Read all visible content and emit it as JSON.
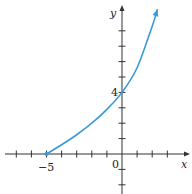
{
  "chart_data": {
    "type": "line",
    "title": "",
    "xlabel": "x",
    "ylabel": "y",
    "xlim": [
      -7.8,
      3.3
    ],
    "ylim": [
      -2.6,
      9.8
    ],
    "grid": false,
    "legend": null,
    "x_tick_labels": [
      {
        "value": -5,
        "label": "−5"
      },
      {
        "value": 0,
        "label": "0"
      }
    ],
    "y_tick_labels": [
      {
        "value": 4,
        "label": "4"
      }
    ],
    "x_ticks": [
      -7,
      -6,
      -5,
      -4,
      -3,
      -2,
      -1,
      1,
      2,
      3
    ],
    "y_ticks": [
      -2,
      -1,
      1,
      2,
      3,
      5,
      6,
      7,
      8
    ],
    "series": [
      {
        "name": "curve",
        "color": "#3a9ad9",
        "start_point": {
          "x": -5,
          "y": 0,
          "marker": "closed-dot"
        },
        "end_arrow": true,
        "x": [
          -5,
          -4,
          -3,
          -2,
          -1,
          0,
          1,
          2,
          2.35
        ],
        "y": [
          0,
          0.6,
          1.25,
          2.0,
          2.9,
          4.0,
          5.6,
          8.3,
          9.4
        ]
      }
    ],
    "annotations": [
      {
        "text": "4",
        "x": 0,
        "y": 4,
        "position": "left"
      },
      {
        "text": "−5",
        "x": -5,
        "y": 0,
        "position": "below"
      },
      {
        "text": "0",
        "x": 0,
        "y": 0,
        "position": "below-left"
      }
    ]
  },
  "labels": {
    "x_axis": "x",
    "y_axis": "y",
    "origin": "0",
    "x_neg5": "−5",
    "y_4": "4"
  },
  "colors": {
    "axis": "#333333",
    "curve": "#3a9ad9"
  }
}
